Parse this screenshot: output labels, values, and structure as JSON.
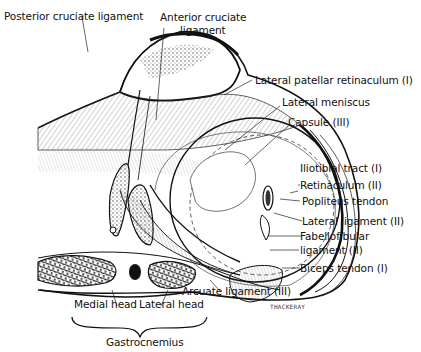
{
  "diagram": {
    "labels": {
      "posterior_cruciate": "Posterior cruciate ligament",
      "anterior_cruciate_1": "Anterior cruciate",
      "anterior_cruciate_2": "ligament",
      "lateral_patellar_retinaculum": "Lateral patellar retinaculum (I)",
      "lateral_meniscus": "Lateral meniscus",
      "capsule": "Capsule (III)",
      "iliotibial_tract": "Iliotibial tract (I)",
      "retinaculum": "Retinaculum (II)",
      "popliteus_tendon": "Popliteus tendon",
      "lateral_ligament": "Lateral ligament (II)",
      "fabellofibular_1": "Fabellofibular",
      "fabellofibular_2": "ligament (II)",
      "biceps_tendon": "Biceps tendon (I)",
      "arcuate_ligament": "Arcuate ligament (III)",
      "medial_head": "Medial head",
      "lateral_head": "Lateral head",
      "gastrocnemius": "Gastrocnemius"
    },
    "signature": "THACKERAY"
  }
}
